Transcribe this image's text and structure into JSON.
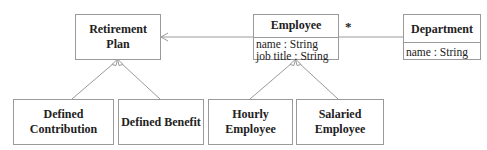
{
  "diagram": {
    "type": "UML class diagram",
    "classes": {
      "retirement_plan": {
        "name": "Retirement Plan"
      },
      "employee": {
        "name": "Employee",
        "attributes": [
          "name : String",
          "job title : String"
        ]
      },
      "department": {
        "name": "Department",
        "attributes": [
          "name : String"
        ]
      },
      "defined_contribution": {
        "name": "Defined Contribution"
      },
      "defined_benefit": {
        "name": "Defined Benefit"
      },
      "hourly_employee": {
        "name": "Hourly Employee"
      },
      "salaried_employee": {
        "name": "Salaried Employee"
      }
    },
    "relationships": [
      {
        "type": "association",
        "from": "Employee",
        "to": "Retirement Plan",
        "navigable_to": "Retirement Plan"
      },
      {
        "type": "association",
        "from": "Employee",
        "to": "Department",
        "multiplicity_employee_end": "*"
      },
      {
        "type": "generalization",
        "child": "Defined Contribution",
        "parent": "Retirement Plan"
      },
      {
        "type": "generalization",
        "child": "Defined Benefit",
        "parent": "Retirement Plan"
      },
      {
        "type": "generalization",
        "child": "Hourly Employee",
        "parent": "Employee"
      },
      {
        "type": "generalization",
        "child": "Salaried Employee",
        "parent": "Employee"
      }
    ],
    "multiplicity_label": "*",
    "colors": {
      "line": "#9a9a9a",
      "text": "#222222",
      "background": "#ffffff"
    }
  }
}
